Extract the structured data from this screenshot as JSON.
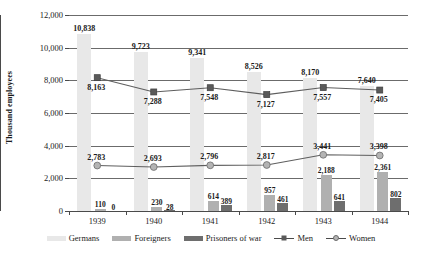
{
  "chart_data": {
    "type": "bar",
    "title": "",
    "xlabel": "",
    "ylabel": "Thousand employees",
    "ylim": [
      0,
      12000
    ],
    "ytick_labels": [
      "0",
      "2,000",
      "4,000",
      "6,000",
      "8,000",
      "10,000",
      "12,000"
    ],
    "ytick_values": [
      0,
      2000,
      4000,
      6000,
      8000,
      10000,
      12000
    ],
    "grid": true,
    "legend_position": "bottom",
    "categories": [
      "1939",
      "1940",
      "1941",
      "1942",
      "1943",
      "1944"
    ],
    "series": [
      {
        "name": "Germans",
        "kind": "bar",
        "color": "#e8e8e8",
        "values": [
          10838,
          9723,
          9341,
          8526,
          8170,
          7640
        ],
        "labels": [
          "10,838",
          "9,723",
          "9,341",
          "8,526",
          "8,170",
          "7,640"
        ]
      },
      {
        "name": "Foreigners",
        "kind": "bar",
        "color": "#b0b0b0",
        "values": [
          110,
          230,
          614,
          957,
          2188,
          2361
        ],
        "labels": [
          "110",
          "230",
          "614",
          "957",
          "2,188",
          "2,361"
        ]
      },
      {
        "name": "Prisoners of war",
        "kind": "bar",
        "color": "#6e6e6e",
        "values": [
          0,
          28,
          389,
          461,
          641,
          802
        ],
        "labels": [
          "0",
          "28",
          "389",
          "461",
          "641",
          "802"
        ]
      },
      {
        "name": "Men",
        "kind": "line",
        "marker": "square",
        "color": "#5a5a5a",
        "values": [
          8163,
          7288,
          7548,
          7127,
          7557,
          7405
        ],
        "labels": [
          "8,163",
          "7,288",
          "7,548",
          "7,127",
          "7,557",
          "7,405"
        ]
      },
      {
        "name": "Women",
        "kind": "line",
        "marker": "circle",
        "color": "#b4b4b4",
        "values": [
          2783,
          2693,
          2796,
          2817,
          3441,
          3398
        ],
        "labels": [
          "2,783",
          "2,693",
          "2,796",
          "2,817",
          "3,441",
          "3,398"
        ]
      }
    ]
  },
  "legend": {
    "items": [
      {
        "label": "Germans"
      },
      {
        "label": "Foreigners"
      },
      {
        "label": "Prisoners of war"
      },
      {
        "label": "Men"
      },
      {
        "label": "Women"
      }
    ]
  }
}
